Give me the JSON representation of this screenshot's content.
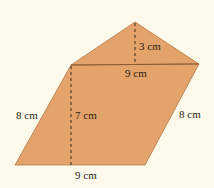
{
  "figure": {
    "colors": {
      "fill": "#e3a36a",
      "stroke": "#8a5a33",
      "dash": "#3a2a1e",
      "background": "#fdfaec"
    },
    "labels": {
      "triangle_height": "3 cm",
      "shared_base": "9 cm",
      "left_side": "8 cm",
      "parallelogram_height": "7 cm",
      "right_side": "8 cm",
      "bottom_base": "9 cm"
    }
  }
}
